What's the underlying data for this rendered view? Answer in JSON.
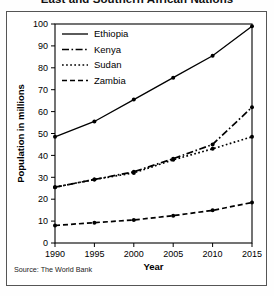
{
  "chart_data": {
    "type": "line",
    "title": "East and Southern African Nations",
    "xlabel": "Year",
    "ylabel": "Population in millions",
    "source": "Source: The World Bank",
    "x": [
      1990,
      1995,
      2000,
      2005,
      2010,
      2015
    ],
    "x_tick_labels": [
      "1990",
      "1995",
      "2000",
      "2005",
      "2010",
      "2015"
    ],
    "y_tick_labels": [
      "0",
      "10",
      "20",
      "30",
      "40",
      "50",
      "60",
      "70",
      "80",
      "90",
      "100"
    ],
    "y_ticks": [
      0,
      10,
      20,
      30,
      40,
      50,
      60,
      70,
      80,
      90,
      100
    ],
    "ylim": [
      0,
      100
    ],
    "xlim": [
      1990,
      2015
    ],
    "grid": false,
    "legend_position": "top-left-inside",
    "series": [
      {
        "name": "Ethiopia",
        "dash": "solid",
        "values": [
          48.5,
          55.5,
          65.5,
          75.5,
          85.5,
          99.0
        ]
      },
      {
        "name": "Kenya",
        "dash": "dash-dot",
        "values": [
          25.5,
          29.0,
          32.5,
          38.5,
          45.0,
          62.0
        ]
      },
      {
        "name": "Sudan",
        "dash": "dotted",
        "values": [
          25.5,
          29.0,
          32.0,
          38.0,
          43.0,
          48.5
        ]
      },
      {
        "name": "Zambia",
        "dash": "dashed",
        "values": [
          8.0,
          9.3,
          10.5,
          12.5,
          14.9,
          18.5
        ]
      }
    ]
  }
}
